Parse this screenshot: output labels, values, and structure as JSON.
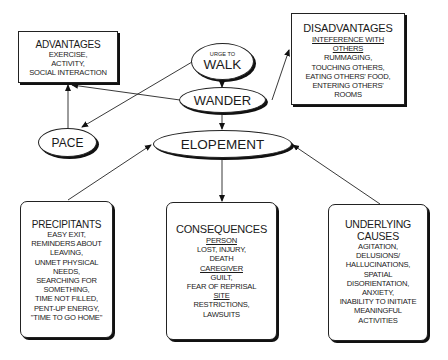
{
  "nodes": {
    "urge": {
      "small": "URGE TO",
      "big": "WALK"
    },
    "wander": {
      "label": "WANDER"
    },
    "elopement": {
      "label": "ELOPEMENT"
    },
    "pace": {
      "label": "PACE"
    }
  },
  "advantages": {
    "title": "ADVANTAGES",
    "lines": [
      "EXERCISE,",
      "ACTIVITY,",
      "SOCIAL INTERACTION"
    ]
  },
  "disadvantages": {
    "title": "DISADVANTAGES",
    "subheading": [
      "INTEFERENCE WITH",
      "OTHERS"
    ],
    "lines": [
      "RUMMAGING,",
      "TOUCHING OTHERS,",
      "EATING OTHERS' FOOD,",
      "ENTERING OTHERS'",
      "ROOMS"
    ]
  },
  "precipitants": {
    "title": "PRECIPITANTS",
    "lines": [
      "EASY EXIT,",
      "REMINDERS ABOUT",
      "LEAVING,",
      "UNMET PHYSICAL",
      "NEEDS,",
      "SEARCHING FOR",
      "SOMETHING,",
      "TIME NOT FILLED,",
      "PENT-UP ENERGY,",
      "\"TIME TO GO HOME\""
    ]
  },
  "consequences": {
    "title": "CONSEQUENCES",
    "person_heading": "PERSON",
    "person_lines": [
      "LOST, INJURY,",
      "DEATH"
    ],
    "caregiver_heading": "CAREGIVER",
    "caregiver_lines": [
      "GUILT,",
      "FEAR OF REPRISAL"
    ],
    "site_heading": "SITE",
    "site_lines": [
      "RESTRICTIONS,",
      "LAWSUITS"
    ]
  },
  "underlying": {
    "title_lines": [
      "UNDERLYING",
      "CAUSES"
    ],
    "lines": [
      "AGITATION,",
      "DELUSIONS/",
      "HALLUCINATIONS,",
      "SPATIAL",
      "DISORIENTATION,",
      "ANXIETY,",
      "INABILITY TO INITIATE",
      "MEANINGFUL",
      "ACTIVITIES"
    ]
  }
}
